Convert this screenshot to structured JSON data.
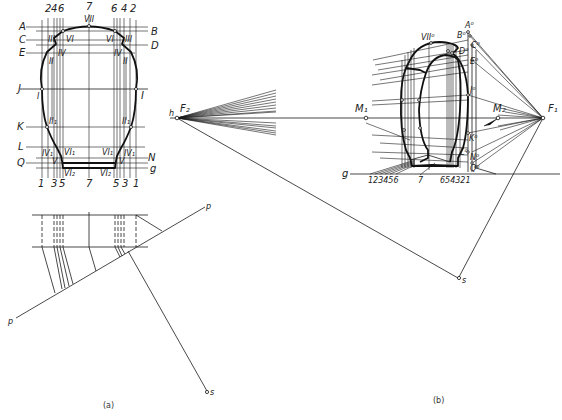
{
  "figure_a": {
    "caption": "(a)",
    "top_numbers": [
      "2",
      "4",
      "6",
      "7",
      "6",
      "4",
      "2"
    ],
    "bottom_numbers": [
      "1",
      "3",
      "5",
      "7",
      "5",
      "3",
      "1"
    ],
    "left_letters": [
      "A",
      "C",
      "E",
      "J",
      "K",
      "L",
      "Q"
    ],
    "right_letters": [
      "B",
      "D",
      "I",
      "N",
      "g"
    ],
    "roman_labels": {
      "vii": "VII",
      "iii_l": "III",
      "vi_l": "VI",
      "iv_l": "IV",
      "ii_l": "II",
      "i_l": "I",
      "iii_r": "III",
      "vi_r": "VI",
      "iv_r": "IV",
      "ii_r": "II",
      "i_r": "I",
      "ii1_l": "II₁",
      "iv1_l": "IV₁",
      "vi1_l": "VI₁",
      "v_l": "V",
      "vi2_l": "VI₂",
      "ii1_r": "II₁",
      "iv1_r": "IV₁",
      "vi1_r": "VI₁",
      "v_r": "V",
      "vi2_r": "VI₂"
    },
    "plan_labels": {
      "p_top": "p",
      "p_bottom": "p",
      "s": "s"
    }
  },
  "center": {
    "h": "h",
    "f2": "F₂"
  },
  "figure_b": {
    "caption": "(b)",
    "vii0": "VII⁰",
    "a0": "A⁰",
    "b0": "B⁰",
    "c0": "C⁰",
    "d0": "D⁰",
    "e0": "E⁰",
    "j0": "J⁰",
    "k0": "K⁰",
    "l0": "L⁰",
    "n0": "N⁰",
    "q0": "Q⁰",
    "m1": "M₁",
    "m2": "M₂",
    "f1": "F₁",
    "g": "g",
    "s": "s",
    "base_left": "123456",
    "base_mid": "7",
    "base_right": "654321"
  }
}
